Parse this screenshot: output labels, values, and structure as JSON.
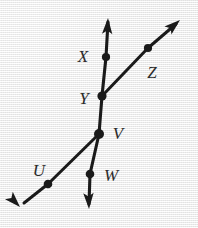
{
  "figure": {
    "kind": "geometry-line-diagram",
    "width": 198,
    "height": 228,
    "background_color": "#ececec",
    "ink_color": "#1a1a1a",
    "label_color": "#2b2b2b"
  },
  "labels": [
    {
      "id": "X",
      "text": "X",
      "x": 83,
      "y": 56
    },
    {
      "id": "Z",
      "text": "Z",
      "x": 152,
      "y": 72
    },
    {
      "id": "Y",
      "text": "Y",
      "x": 84,
      "y": 98
    },
    {
      "id": "V",
      "text": "V",
      "x": 118,
      "y": 133
    },
    {
      "id": "U",
      "text": "U",
      "x": 39,
      "y": 170
    },
    {
      "id": "W",
      "text": "W",
      "x": 111,
      "y": 175
    }
  ],
  "points": [
    {
      "id": "X",
      "x": 106,
      "y": 57,
      "type": "marked-point"
    },
    {
      "id": "Z",
      "x": 148,
      "y": 48,
      "type": "marked-point"
    },
    {
      "id": "Y",
      "x": 102,
      "y": 96,
      "type": "intersection"
    },
    {
      "id": "V",
      "x": 99,
      "y": 134,
      "type": "intersection"
    },
    {
      "id": "U",
      "x": 48,
      "y": 184,
      "type": "marked-point"
    },
    {
      "id": "W",
      "x": 90,
      "y": 174,
      "type": "marked-point"
    }
  ],
  "lines": [
    {
      "id": "line-vertical",
      "name": "near-vertical line through X, Y, V, W",
      "path": "M 108 22 L 106 57 L 102 96 L 99 134 L 90 174 L 89 204",
      "arrow_start": {
        "x": 108,
        "y": 18,
        "angle_deg": -93
      },
      "arrow_end": {
        "x": 89,
        "y": 209,
        "angle_deg": 88
      },
      "passes_through": [
        "X",
        "Y",
        "V",
        "W"
      ]
    },
    {
      "id": "ray-upper-right",
      "name": "ray from Y up-right through Z",
      "path": "M 102 96 L 148 48 L 176 24",
      "arrow_end": {
        "x": 180,
        "y": 20,
        "angle_deg": -41
      },
      "passes_through": [
        "Y",
        "Z"
      ]
    },
    {
      "id": "ray-lower-left",
      "name": "ray from V down-left through U",
      "path": "M 99 134 L 48 184 L 24 203",
      "arrow_end": {
        "x": 20,
        "y": 207,
        "angle_deg": 140
      },
      "passes_through": [
        "V",
        "U"
      ]
    }
  ]
}
